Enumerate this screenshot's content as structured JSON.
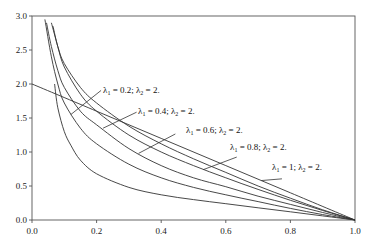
{
  "chart_data": {
    "type": "line",
    "title": "",
    "xlabel": "",
    "ylabel": "",
    "xlim": [
      0.0,
      1.0
    ],
    "ylim": [
      0.0,
      3.0
    ],
    "grid": false,
    "legend": "inline leader-line labels",
    "x_ticks": [
      "0.0",
      "0.2",
      "0.4",
      "0.6",
      "0.8",
      "1.0"
    ],
    "y_ticks": [
      "0.0",
      "0.5",
      "1.0",
      "1.5",
      "2.0",
      "2.5",
      "3.0"
    ],
    "series": [
      {
        "name": "λ1 = 1; λ2 = 2.",
        "x": [
          0.0,
          0.2,
          0.4,
          0.6,
          0.8,
          1.0
        ],
        "y": [
          2.0,
          1.6,
          1.2,
          0.8,
          0.4,
          0.0
        ]
      },
      {
        "name": "λ1 = 0.8; λ2 = 2.",
        "x": [
          0.065,
          0.08,
          0.1,
          0.15,
          0.2,
          0.3,
          0.4,
          0.5,
          0.6,
          0.7,
          0.8,
          0.9,
          1.0
        ],
        "y": [
          2.85,
          2.55,
          2.3,
          1.95,
          1.72,
          1.38,
          1.12,
          0.9,
          0.7,
          0.5,
          0.32,
          0.15,
          0.0
        ]
      },
      {
        "name": "λ1 = 0.6; λ2 = 2.",
        "x": [
          0.06,
          0.08,
          0.1,
          0.15,
          0.2,
          0.3,
          0.4,
          0.5,
          0.6,
          0.7,
          0.8,
          0.9,
          1.0
        ],
        "y": [
          2.9,
          2.55,
          2.25,
          1.85,
          1.6,
          1.25,
          1.0,
          0.8,
          0.62,
          0.45,
          0.29,
          0.14,
          0.0
        ]
      },
      {
        "name": "λ1 = 0.4; λ2 = 2.",
        "x": [
          0.045,
          0.06,
          0.08,
          0.1,
          0.15,
          0.2,
          0.3,
          0.4,
          0.5,
          0.6,
          0.7,
          0.8,
          0.9,
          1.0
        ],
        "y": [
          2.9,
          2.55,
          2.2,
          1.95,
          1.6,
          1.4,
          1.05,
          0.8,
          0.62,
          0.49,
          0.35,
          0.23,
          0.11,
          0.0
        ]
      },
      {
        "name": "λ1 = 0.2; λ2 = 2.",
        "x": [
          0.04,
          0.06,
          0.08,
          0.1,
          0.15,
          0.2,
          0.3,
          0.4,
          0.5,
          0.6,
          0.7,
          0.8,
          0.9,
          1.0
        ],
        "y": [
          2.95,
          2.4,
          2.0,
          1.72,
          1.35,
          1.12,
          0.82,
          0.62,
          0.48,
          0.37,
          0.27,
          0.17,
          0.08,
          0.0
        ]
      },
      {
        "name": "",
        "x": [
          0.07,
          0.08,
          0.1,
          0.12,
          0.15,
          0.2,
          0.3,
          0.4,
          0.5,
          0.6,
          0.7,
          0.8,
          0.9,
          1.0
        ],
        "y": [
          2.0,
          1.65,
          1.3,
          1.1,
          0.88,
          0.68,
          0.48,
          0.37,
          0.3,
          0.24,
          0.18,
          0.12,
          0.06,
          0.0
        ]
      }
    ],
    "annotations": [
      {
        "text": "λ1 = 0.2; λ2 = 2.",
        "label_x": 0.22,
        "label_y": 1.92,
        "points_to": [
          0.12,
          1.55
        ]
      },
      {
        "text": "λ1 = 0.4; λ2 = 2.",
        "label_x": 0.33,
        "label_y": 1.6,
        "points_to": [
          0.22,
          1.35
        ]
      },
      {
        "text": "λ1 = 0.6; λ2 = 2.",
        "label_x": 0.45,
        "label_y": 1.28,
        "points_to": [
          0.33,
          0.98
        ]
      },
      {
        "text": "λ1 = 0.8; λ2 = 2.",
        "label_x": 0.64,
        "label_y": 0.94,
        "points_to": [
          0.53,
          0.74
        ]
      },
      {
        "text": "λ1 = 1; λ2 = 2.",
        "label_x": 0.78,
        "label_y": 0.62,
        "points_to": [
          0.71,
          0.58
        ]
      }
    ]
  },
  "labels": {
    "l1": {
      "sym1": "λ",
      "sub1": "1",
      "mid": " = 0.2; ",
      "sym2": "λ",
      "sub2": "2",
      "end": " = 2."
    },
    "l2": {
      "sym1": "λ",
      "sub1": "1",
      "mid": " = 0.4; ",
      "sym2": "λ",
      "sub2": "2",
      "end": " = 2."
    },
    "l3": {
      "sym1": "λ",
      "sub1": "1",
      "mid": " = 0.6; ",
      "sym2": "λ",
      "sub2": "2",
      "end": " = 2."
    },
    "l4": {
      "sym1": "λ",
      "sub1": "1",
      "mid": " = 0.8; ",
      "sym2": "λ",
      "sub2": "2",
      "end": " = 2."
    },
    "l5": {
      "sym1": "λ",
      "sub1": "1",
      "mid": " = 1; ",
      "sym2": "λ",
      "sub2": "2",
      "end": " = 2."
    }
  },
  "colors": {
    "line": "#333333",
    "axis": "#444444",
    "text": "#222222",
    "background": "#ffffff"
  }
}
